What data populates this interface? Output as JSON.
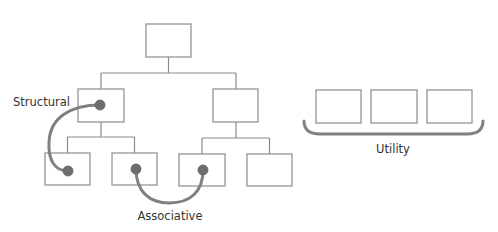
{
  "labels": {
    "structural": "Structural",
    "associative": "Associative",
    "utility": "Utility"
  },
  "diagram": {
    "type": "hierarchy-with-relationships",
    "tree": {
      "root": {
        "id": "root",
        "children": [
          "mid-left",
          "mid-right"
        ]
      },
      "mid-left": {
        "children": [
          "leaf-1",
          "leaf-2"
        ],
        "has_dot": true
      },
      "mid-right": {
        "children": [
          "leaf-3",
          "leaf-4"
        ],
        "has_dot": false
      },
      "leaves": [
        {
          "id": "leaf-1",
          "has_dot": true
        },
        {
          "id": "leaf-2",
          "has_dot": true
        },
        {
          "id": "leaf-3",
          "has_dot": true
        },
        {
          "id": "leaf-4",
          "has_dot": false
        }
      ]
    },
    "relationships": [
      {
        "type": "Structural",
        "from": "mid-left",
        "to": "leaf-1"
      },
      {
        "type": "Associative",
        "from": "leaf-2",
        "to": "leaf-3"
      }
    ],
    "utility_group": {
      "label": "Utility",
      "box_count": 3
    }
  },
  "colors": {
    "box_stroke": "#8c8c8c",
    "connector": "#808080",
    "dot": "#6e6e6e",
    "text": "#333333"
  }
}
